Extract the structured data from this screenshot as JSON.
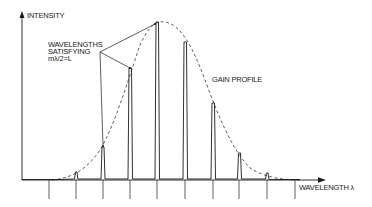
{
  "diagram": {
    "y_axis_label": "INTENSITY",
    "x_axis_label": "WAVELENGTH λ",
    "annotation": {
      "line1": "WAVELENGTHS",
      "line2": "SATISFYING",
      "line3": "mλ/2=L"
    },
    "curve_label": "GAIN PROFILE",
    "colors": {
      "ink": "#1a1a1a",
      "background": "#ffffff"
    },
    "modes": [
      {
        "x": 76,
        "top": 172
      },
      {
        "x": 103,
        "top": 147
      },
      {
        "x": 130,
        "top": 68
      },
      {
        "x": 157,
        "top": 22
      },
      {
        "x": 185,
        "top": 42
      },
      {
        "x": 213,
        "top": 103
      },
      {
        "x": 239,
        "top": 153
      },
      {
        "x": 267,
        "top": 173
      }
    ],
    "ticks": [
      49,
      76,
      103,
      130,
      157,
      185,
      213,
      239,
      267,
      295
    ]
  }
}
